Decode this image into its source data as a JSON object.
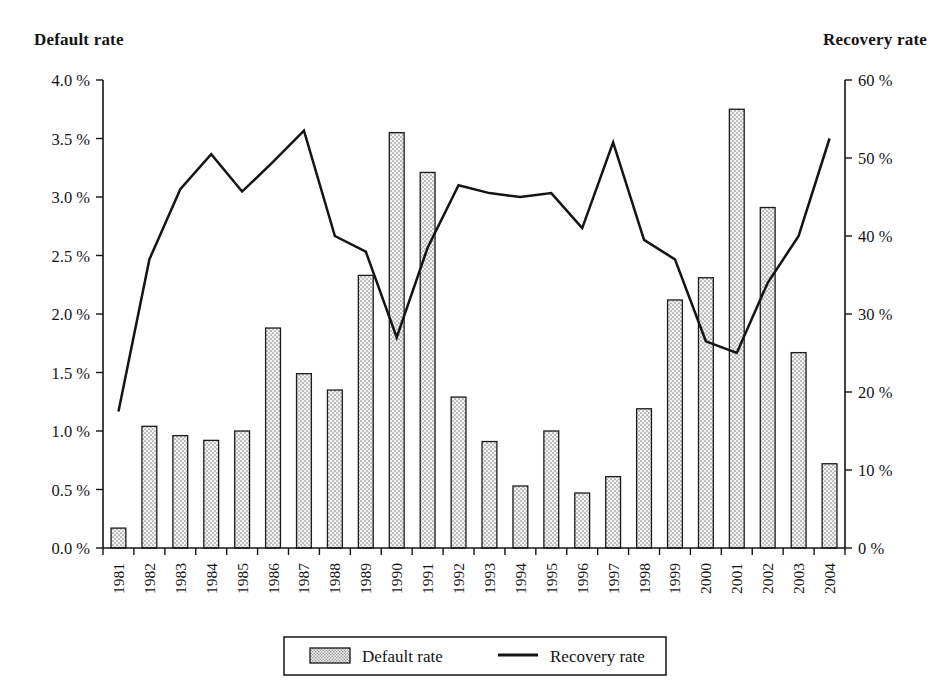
{
  "chart_data": {
    "type": "bar",
    "title": "",
    "subtitle": "",
    "xlabel": "",
    "ylabel": "Default rate",
    "y2label": "Recovery rate",
    "grid": false,
    "legend_position": "bottom",
    "categories": [
      "1981",
      "1982",
      "1983",
      "1984",
      "1985",
      "1986",
      "1987",
      "1988",
      "1989",
      "1990",
      "1991",
      "1992",
      "1993",
      "1994",
      "1995",
      "1996",
      "1997",
      "1998",
      "1999",
      "2000",
      "2001",
      "2002",
      "2003",
      "2004"
    ],
    "ylim": [
      0,
      4.0
    ],
    "y2lim": [
      0,
      60
    ],
    "yticks": [
      "0.0 %",
      "0.5 %",
      "1.0 %",
      "1.5 %",
      "2.0 %",
      "2.5 %",
      "3.0 %",
      "3.5 %",
      "4.0 %"
    ],
    "ytick_values": [
      0,
      0.5,
      1.0,
      1.5,
      2.0,
      2.5,
      3.0,
      3.5,
      4.0
    ],
    "y2ticks": [
      "0 %",
      "10 %",
      "20 %",
      "30 %",
      "40 %",
      "50 %",
      "60 %"
    ],
    "y2tick_values": [
      0,
      10,
      20,
      30,
      40,
      50,
      60
    ],
    "series": [
      {
        "name": "Default rate",
        "kind": "bar",
        "axis": "left",
        "unit": "%",
        "values": [
          0.17,
          1.04,
          0.96,
          0.92,
          1.0,
          1.88,
          1.49,
          1.35,
          2.33,
          3.55,
          3.21,
          1.29,
          0.91,
          0.53,
          1.0,
          0.47,
          0.61,
          1.19,
          2.12,
          2.31,
          3.75,
          2.91,
          1.67,
          0.72
        ]
      },
      {
        "name": "Recovery rate",
        "kind": "line",
        "axis": "right",
        "unit": "%",
        "values": [
          17.5,
          37.0,
          46.0,
          50.5,
          45.7,
          49.5,
          53.5,
          40.0,
          38.0,
          27.0,
          38.5,
          46.5,
          45.5,
          45.0,
          45.5,
          41.0,
          52.0,
          39.5,
          37.0,
          26.5,
          25.0,
          34.0,
          40.0,
          52.5
        ]
      }
    ],
    "legend": [
      {
        "label": "Default rate",
        "marker": "stippled-swatch"
      },
      {
        "label": "Recovery rate",
        "marker": "line"
      }
    ],
    "colors": {
      "ink": "#141414",
      "bar_fill": "#e8e8e8",
      "bar_stroke": "#1a1a1a",
      "line": "#141414",
      "background": "#ffffff"
    }
  }
}
